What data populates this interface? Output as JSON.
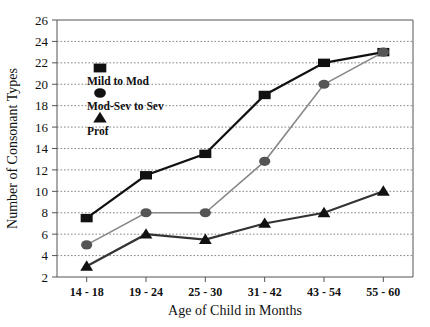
{
  "chart_data": {
    "type": "line",
    "title": "",
    "xlabel": "Age of Child in Months",
    "ylabel": "Number of Consonant Types",
    "categories": [
      "14 - 18",
      "19 - 24",
      "25 - 30",
      "31 - 42",
      "43 - 54",
      "55 - 60"
    ],
    "ylim": [
      2,
      26
    ],
    "ytick_step": 2,
    "yticks": [
      2,
      4,
      6,
      8,
      10,
      12,
      14,
      16,
      18,
      20,
      22,
      24,
      26
    ],
    "ytick_labels": [
      "2",
      "4",
      "6",
      "8",
      "10",
      "12",
      "14",
      "16",
      "18",
      "20",
      "22",
      "24",
      "26"
    ],
    "grid": true,
    "grid_style": "dotted-horizontal",
    "legend_position": "inside-upper-left",
    "series": [
      {
        "name": "Mild to Mod",
        "marker": "square",
        "color": "#111111",
        "line_color": "#111111",
        "values": [
          7.5,
          11.5,
          13.5,
          19,
          22,
          23
        ]
      },
      {
        "name": "Mod-Sev to Sev",
        "marker": "circle",
        "color": "#555555",
        "line_color": "#888888",
        "values": [
          5,
          8,
          8,
          12.8,
          20,
          23
        ]
      },
      {
        "name": "Prof",
        "marker": "triangle",
        "color": "#111111",
        "line_color": "#333333",
        "values": [
          3,
          6,
          5.5,
          7,
          8,
          10
        ]
      }
    ]
  },
  "legend": {
    "items": [
      {
        "label": "Mild to Mod",
        "marker": "square"
      },
      {
        "label": "Mod-Sev to Sev",
        "marker": "circle"
      },
      {
        "label": "Prof",
        "marker": "triangle"
      }
    ]
  },
  "colors": {
    "axis": "#555555",
    "grid": "#777777",
    "text": "#111111",
    "background": "#ffffff"
  }
}
